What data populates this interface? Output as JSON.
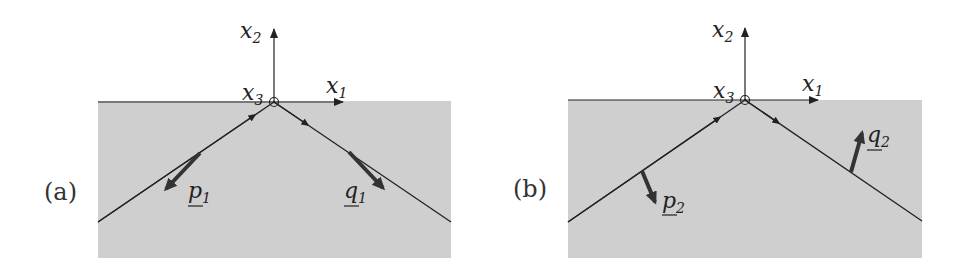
{
  "figure": {
    "panels": [
      {
        "id": "a",
        "label": "(a)",
        "axes": {
          "x1": "x",
          "x1_sub": "1",
          "x2": "x",
          "x2_sub": "2",
          "x3": "x",
          "x3_sub": "3"
        },
        "vectors": [
          {
            "name": "p",
            "sub": "1",
            "direction": "along incident ray, pointing away from origin"
          },
          {
            "name": "q",
            "sub": "1",
            "direction": "along reflected ray, pointing away from origin"
          }
        ]
      },
      {
        "id": "b",
        "label": "(b)",
        "axes": {
          "x1": "x",
          "x1_sub": "1",
          "x2": "x",
          "x2_sub": "2",
          "x3": "x",
          "x3_sub": "3"
        },
        "vectors": [
          {
            "name": "p",
            "sub": "2",
            "direction": "normal to incident ray, pointing down"
          },
          {
            "name": "q",
            "sub": "2",
            "direction": "normal to reflected ray, pointing up"
          }
        ]
      }
    ],
    "colors": {
      "medium": "#cfcfcf",
      "line": "#222222",
      "vector": "#333333"
    }
  }
}
